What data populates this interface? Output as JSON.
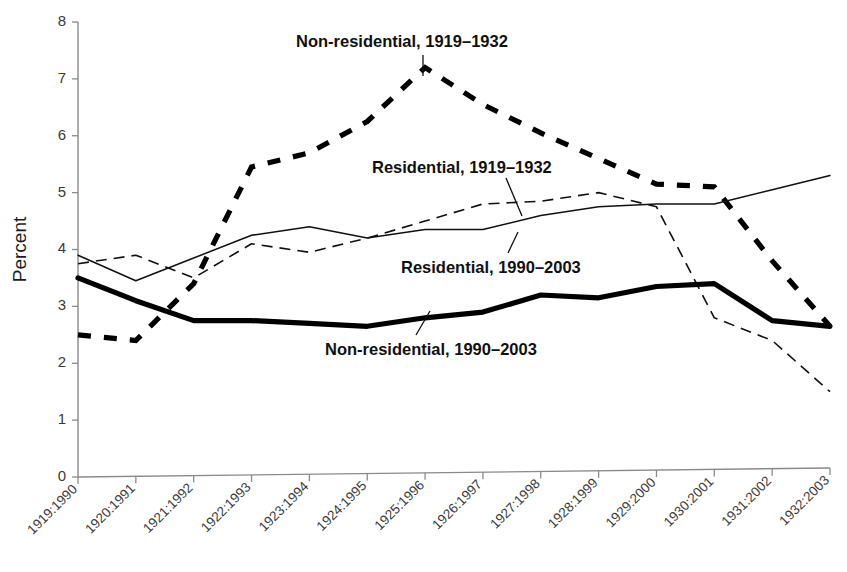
{
  "chart_data": {
    "type": "line",
    "title": "",
    "subtitle": "",
    "xlabel": "",
    "ylabel": "Percent",
    "ylim": [
      0,
      8
    ],
    "yticks": [
      0,
      1,
      2,
      3,
      4,
      5,
      6,
      7,
      8
    ],
    "ytick_labels": [
      "0",
      "1",
      "2",
      "3",
      "4",
      "5",
      "6",
      "7",
      "8"
    ],
    "grid": false,
    "legend": "inline-annotations",
    "categories": [
      "1919:1990",
      "1920:1991",
      "1921:1992",
      "1922:1993",
      "1923:1994",
      "1924:1995",
      "1925:1996",
      "1926:1997",
      "1927:1998",
      "1928:1999",
      "1929:2000",
      "1930:2001",
      "1931:2002",
      "1932:2003"
    ],
    "series": [
      {
        "name": "Non-residential, 1919–1932",
        "style": "thick-dashed",
        "color": "#000000",
        "values": [
          2.5,
          2.4,
          3.4,
          5.45,
          5.7,
          6.25,
          7.2,
          6.55,
          6.05,
          5.6,
          5.15,
          5.1,
          3.8,
          2.65
        ]
      },
      {
        "name": "Residential, 1919–1932",
        "style": "thin-dashed",
        "color": "#111111",
        "values": [
          3.75,
          3.9,
          3.5,
          4.1,
          3.95,
          4.2,
          4.5,
          4.8,
          4.85,
          5.0,
          4.75,
          2.8,
          2.4,
          1.5
        ]
      },
      {
        "name": "Residential, 1990–2003",
        "style": "thin-solid",
        "color": "#111111",
        "values": [
          3.9,
          3.45,
          3.85,
          4.25,
          4.4,
          4.2,
          4.35,
          4.35,
          4.6,
          4.75,
          4.8,
          4.8,
          5.05,
          5.3
        ]
      },
      {
        "name": "Non-residential, 1990–2003",
        "style": "thick-solid",
        "color": "#000000",
        "values": [
          3.5,
          3.1,
          2.75,
          2.75,
          2.7,
          2.65,
          2.8,
          2.9,
          3.2,
          3.15,
          3.35,
          3.4,
          2.75,
          2.65
        ]
      }
    ],
    "annotations": [
      {
        "id": "nonres-1919",
        "text": "Non-residential, 1919–1932",
        "x_px": 296,
        "y_px": 32,
        "leader": "M 423 55 L 423 76"
      },
      {
        "id": "res-1919",
        "text": "Residential, 1919–1932",
        "x_px": 372,
        "y_px": 158,
        "leader": "M 506 178 L 522 216"
      },
      {
        "id": "res-1990",
        "text": "Residential, 1990–2003",
        "x_px": 401,
        "y_px": 258,
        "leader": "M 508 253 L 518 232"
      },
      {
        "id": "nonres-1990",
        "text": "Non-residential, 1990–2003",
        "x_px": 325,
        "y_px": 340,
        "leader": "M 416 335 L 430 311"
      }
    ]
  }
}
